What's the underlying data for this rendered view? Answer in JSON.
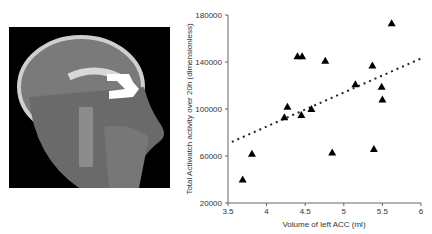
{
  "figure": {
    "left_panel": {
      "description": "Sagittal brain MRI with highlighted left ACC region",
      "highlight_color": "#ffffff"
    },
    "right_panel": "scatter"
  },
  "chart_data": {
    "type": "scatter",
    "title": "",
    "xlabel": "Volume of left ACC (ml)",
    "ylabel": "Total Actiwatch activity over 20h (dimensionless)",
    "xlim": [
      3.5,
      6
    ],
    "ylim": [
      20000,
      180000
    ],
    "xticks": [
      "3.5",
      "4",
      "4.5",
      "5",
      "5.5",
      "6"
    ],
    "yticks": [
      "20000",
      "60000",
      "100000",
      "140000",
      "180000"
    ],
    "grid": false,
    "legend": null,
    "marker": "triangle",
    "series": [
      {
        "name": "subjects",
        "points": [
          [
            3.69,
            40000
          ],
          [
            3.81,
            62000
          ],
          [
            4.23,
            93000
          ],
          [
            4.27,
            102000
          ],
          [
            4.4,
            145000
          ],
          [
            4.46,
            145000
          ],
          [
            4.45,
            95000
          ],
          [
            4.58,
            100000
          ],
          [
            4.76,
            141000
          ],
          [
            4.85,
            63000
          ],
          [
            5.15,
            121000
          ],
          [
            5.37,
            137000
          ],
          [
            5.39,
            66000
          ],
          [
            5.49,
            119000
          ],
          [
            5.5,
            108000
          ],
          [
            5.62,
            173000
          ]
        ]
      }
    ],
    "trendline": {
      "style": "dotted",
      "x": [
        3.55,
        6
      ],
      "y": [
        72000,
        143000
      ]
    }
  }
}
